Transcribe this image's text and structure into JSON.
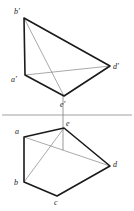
{
  "figure": {
    "canvas": {
      "width": 134,
      "height": 211
    },
    "colors": {
      "outline": "#1a1a1a",
      "thin_line": "#6e6e6e",
      "ground_line": "#7a7a7a",
      "projector": "#555555",
      "background": "#ffffff"
    },
    "stroke_widths": {
      "outline": 1.6,
      "thin_line": 0.6,
      "ground_line": 0.7,
      "projector": 0.6
    },
    "ground_line": {
      "label": "ground-line",
      "x1": 2,
      "y1": 115,
      "x2": 132,
      "y2": 115
    },
    "projector": {
      "label": "vertical-projector-e",
      "x1": 63,
      "y1": 96,
      "x2": 63,
      "y2": 150
    },
    "front_view": {
      "name": "front-elevation",
      "points": {
        "b_prime": {
          "label": "b'",
          "x": 24,
          "y": 18,
          "lx": 14,
          "ly": 8
        },
        "a_prime": {
          "label": "a'",
          "x": 25,
          "y": 75,
          "lx": 11,
          "ly": 76
        },
        "d_prime": {
          "label": "d'",
          "x": 110,
          "y": 66,
          "lx": 113,
          "ly": 63
        },
        "e_prime": {
          "label": "e'",
          "x": 64,
          "y": 96,
          "lx": 60,
          "ly": 101
        }
      },
      "outline_path": [
        "b_prime",
        "d_prime",
        "e_prime",
        "a_prime",
        "b_prime"
      ],
      "thin_edges": [
        {
          "from": "a_prime",
          "to": "d_prime"
        },
        {
          "from": "b_prime",
          "to": "e_prime"
        }
      ]
    },
    "top_view": {
      "name": "top-plan",
      "points": {
        "a": {
          "label": "a",
          "x": 24,
          "y": 137,
          "lx": 15,
          "ly": 128
        },
        "b": {
          "label": "b",
          "x": 24,
          "y": 182,
          "lx": 14,
          "ly": 179
        },
        "c": {
          "label": "c",
          "x": 57,
          "y": 196,
          "lx": 54,
          "ly": 199
        },
        "d": {
          "label": "d",
          "x": 110,
          "y": 166,
          "lx": 113,
          "ly": 161
        },
        "e": {
          "label": "e",
          "x": 64,
          "y": 128,
          "lx": 66,
          "ly": 120
        }
      },
      "outline_path": [
        "a",
        "e",
        "d",
        "c",
        "b",
        "a"
      ],
      "thin_edges": [
        {
          "from": "a",
          "to": "d"
        },
        {
          "from": "b",
          "to": "e"
        }
      ]
    }
  }
}
